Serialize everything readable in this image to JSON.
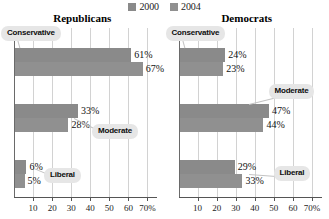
{
  "legend": {
    "entries": [
      {
        "label": "2000",
        "color": "#8a8a8a",
        "icon": "legend-swatch"
      },
      {
        "label": "2004",
        "color": "#909090",
        "icon": "legend-swatch"
      }
    ]
  },
  "axis": {
    "ticks": [
      "10",
      "20",
      "30",
      "40",
      "50",
      "60",
      "70%"
    ],
    "tick_values": [
      10,
      20,
      30,
      40,
      50,
      60,
      70
    ],
    "min": 0,
    "max": 75
  },
  "panels": [
    {
      "title": "Republicans",
      "groups": [
        {
          "label": "Conservative",
          "bars": [
            {
              "series": "2000",
              "value": 61,
              "value_label": "61%"
            },
            {
              "series": "2004",
              "value": 67,
              "value_label": "67%"
            }
          ]
        },
        {
          "label": "Moderate",
          "bars": [
            {
              "series": "2000",
              "value": 33,
              "value_label": "33%"
            },
            {
              "series": "2004",
              "value": 28,
              "value_label": "28%"
            }
          ]
        },
        {
          "label": "Liberal",
          "bars": [
            {
              "series": "2000",
              "value": 6,
              "value_label": "6%"
            },
            {
              "series": "2004",
              "value": 5,
              "value_label": "5%"
            }
          ]
        }
      ]
    },
    {
      "title": "Democrats",
      "groups": [
        {
          "label": "Conservative",
          "bars": [
            {
              "series": "2000",
              "value": 24,
              "value_label": "24%"
            },
            {
              "series": "2004",
              "value": 23,
              "value_label": "23%"
            }
          ]
        },
        {
          "label": "Moderate",
          "bars": [
            {
              "series": "2000",
              "value": 47,
              "value_label": "47%"
            },
            {
              "series": "2004",
              "value": 44,
              "value_label": "44%"
            }
          ]
        },
        {
          "label": "Liberal",
          "bars": [
            {
              "series": "2000",
              "value": 29,
              "value_label": "29%"
            },
            {
              "series": "2004",
              "value": 33,
              "value_label": "33%"
            }
          ]
        }
      ]
    }
  ],
  "chart_data": {
    "type": "bar",
    "orientation": "horizontal",
    "title": "",
    "xlabel": "",
    "ylabel": "",
    "xlim": [
      0,
      75
    ],
    "grid": true,
    "legend_position": "top-center",
    "panels": [
      {
        "name": "Republicans",
        "categories": [
          "Conservative",
          "Moderate",
          "Liberal"
        ],
        "series": [
          {
            "name": "2000",
            "values": [
              61,
              33,
              6
            ]
          },
          {
            "name": "2004",
            "values": [
              67,
              28,
              5
            ]
          }
        ]
      },
      {
        "name": "Democrats",
        "categories": [
          "Conservative",
          "Moderate",
          "Liberal"
        ],
        "series": [
          {
            "name": "2000",
            "values": [
              24,
              47,
              29
            ]
          },
          {
            "name": "2004",
            "values": [
              23,
              44,
              33
            ]
          }
        ]
      }
    ],
    "xticks": [
      10,
      20,
      30,
      40,
      50,
      60,
      70
    ],
    "xticklabels": [
      "10",
      "20",
      "30",
      "40",
      "50",
      "60",
      "70%"
    ]
  }
}
